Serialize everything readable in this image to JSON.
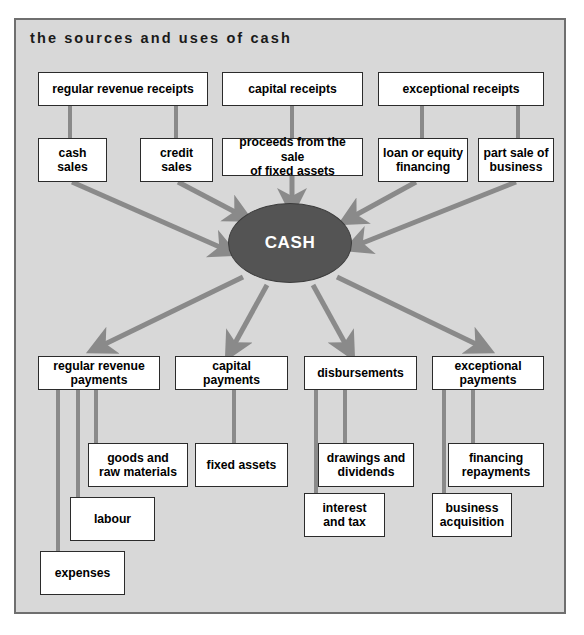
{
  "diagram": {
    "title": "the sources and uses of cash",
    "center": {
      "label": "CASH"
    },
    "colors": {
      "background": "#d8d8d8",
      "frame_border": "#6f6f6f",
      "node_fill": "#ffffff",
      "node_border": "#2b2b2b",
      "center_fill": "#545454",
      "arrow": "#8a8a8a",
      "connector": "#8a8a8a",
      "text": "#000000",
      "center_text": "#ffffff"
    },
    "sources": [
      {
        "id": "regular-revenue-receipts",
        "label": "regular revenue receipts",
        "children": [
          {
            "id": "cash-sales",
            "label": "cash sales"
          },
          {
            "id": "credit-sales",
            "label": "credit sales"
          }
        ]
      },
      {
        "id": "capital-receipts",
        "label": "capital receipts",
        "children": [
          {
            "id": "proceeds-sale-fixed-assets",
            "label": "proceeds from the sale\nof fixed assets"
          }
        ]
      },
      {
        "id": "exceptional-receipts",
        "label": "exceptional receipts",
        "children": [
          {
            "id": "loan-or-equity-financing",
            "label": "loan or equity\nfinancing"
          },
          {
            "id": "part-sale-of-business",
            "label": "part sale of\nbusiness"
          }
        ]
      }
    ],
    "uses": [
      {
        "id": "regular-revenue-payments",
        "label": "regular revenue\npayments",
        "children": [
          {
            "id": "goods-and-raw-materials",
            "label": "goods and\nraw materials"
          },
          {
            "id": "labour",
            "label": "labour"
          },
          {
            "id": "expenses",
            "label": "expenses"
          }
        ]
      },
      {
        "id": "capital-payments",
        "label": "capital\npayments",
        "children": [
          {
            "id": "fixed-assets",
            "label": "fixed assets"
          }
        ]
      },
      {
        "id": "disbursements",
        "label": "disbursements",
        "children": [
          {
            "id": "drawings-and-dividends",
            "label": "drawings and\ndividends"
          },
          {
            "id": "interest-and-tax",
            "label": "interest\nand tax"
          }
        ]
      },
      {
        "id": "exceptional-payments",
        "label": "exceptional\npayments",
        "children": [
          {
            "id": "financing-repayments",
            "label": "financing\nrepayments"
          },
          {
            "id": "business-acquisition",
            "label": "business\nacquisition"
          }
        ]
      }
    ],
    "flow_in_count": 5,
    "flow_out_count": 4
  }
}
